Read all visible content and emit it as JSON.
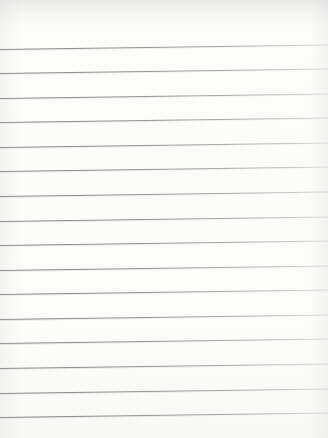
{
  "document": {
    "kind": "lined-paper-scan",
    "title": "Blank ruled notebook paper",
    "width_px": 328,
    "height_px": 438,
    "paper_color": "#fdfdfc",
    "rule_color": "#7a7a7c",
    "written_text": "",
    "top_margin_px": 45,
    "bottom_margin_px": 20,
    "rule_spacing_px": 24.6,
    "rule_slant_deg": -0.8,
    "rule_count": 16,
    "rules": [
      {
        "index": 1,
        "y_left": 48.5,
        "y_right": 44.0
      },
      {
        "index": 2,
        "y_left": 73.0,
        "y_right": 68.6
      },
      {
        "index": 3,
        "y_left": 97.6,
        "y_right": 93.1
      },
      {
        "index": 4,
        "y_left": 122.2,
        "y_right": 117.7
      },
      {
        "index": 5,
        "y_left": 146.8,
        "y_right": 142.3
      },
      {
        "index": 6,
        "y_left": 171.3,
        "y_right": 166.9
      },
      {
        "index": 7,
        "y_left": 195.9,
        "y_right": 191.4
      },
      {
        "index": 8,
        "y_left": 220.5,
        "y_right": 216.0
      },
      {
        "index": 9,
        "y_left": 245.1,
        "y_right": 240.6
      },
      {
        "index": 10,
        "y_left": 269.6,
        "y_right": 265.2
      },
      {
        "index": 11,
        "y_left": 294.2,
        "y_right": 289.7
      },
      {
        "index": 12,
        "y_left": 318.8,
        "y_right": 314.3
      },
      {
        "index": 13,
        "y_left": 343.4,
        "y_right": 338.9
      },
      {
        "index": 14,
        "y_left": 367.9,
        "y_right": 363.5
      },
      {
        "index": 15,
        "y_left": 392.5,
        "y_right": 388.0
      },
      {
        "index": 16,
        "y_left": 417.1,
        "y_right": 412.6
      }
    ]
  }
}
